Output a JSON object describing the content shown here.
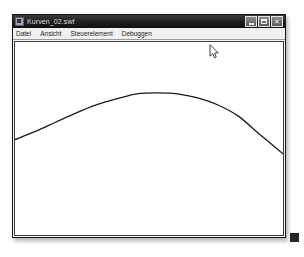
{
  "window": {
    "title": "Kurven_02.swf",
    "app_icon": "flash-player-icon",
    "buttons": [
      {
        "name": "minimize",
        "label": "–",
        "tooltip": "Minimieren"
      },
      {
        "name": "maximize",
        "label": "□",
        "tooltip": "Maximieren"
      },
      {
        "name": "close",
        "label": "✕",
        "tooltip": "Schließen"
      }
    ]
  },
  "menu": {
    "items": [
      {
        "label": "Datei"
      },
      {
        "label": "Ansicht"
      },
      {
        "label": "Steuerelement"
      },
      {
        "label": "Debuggen"
      }
    ]
  },
  "stage": {
    "background": "#ffffff",
    "stroke_color": "#1a1a1a",
    "stroke_width": 1.3,
    "curve_path": "M 1,96 C 40,86 82,52 130,50 C 176,48 221,70 254,100 C 258,104 261,107 263,110",
    "view_box": "0 0 264 190"
  },
  "cursor": {
    "type": "arrow-pointer",
    "x": 209,
    "y": 44
  },
  "chart_data": {
    "type": "line",
    "title": "",
    "xlabel": "",
    "ylabel": "",
    "grid": false,
    "legend": null,
    "series": [
      {
        "name": "Kurve",
        "x": [
          0,
          20,
          40,
          60,
          80,
          100,
          120,
          140,
          160,
          180,
          200,
          220,
          240,
          264
        ],
        "y": [
          96,
          88,
          79,
          70,
          62,
          56,
          51,
          50,
          51,
          55,
          62,
          73,
          90,
          110
        ]
      }
    ],
    "xlim": [
      0,
      264
    ],
    "ylim": [
      190,
      0
    ]
  }
}
